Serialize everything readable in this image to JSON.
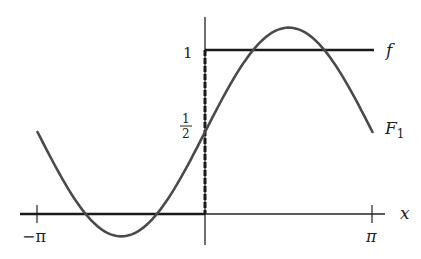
{
  "chart_data": {
    "type": "line",
    "title": "",
    "xlabel": "x",
    "ylabel": "",
    "xlim": [
      -3.14159,
      3.14159
    ],
    "ylim": [
      0,
      1
    ],
    "grid": false,
    "x_ticks": [
      "-π",
      "π"
    ],
    "y_ticks": [
      "1/2",
      "1"
    ],
    "series": [
      {
        "name": "f",
        "style": "step (0 for x<0, 1 for x>0), dashed vertical jump at x=0",
        "x": [
          -3.14159,
          0,
          0,
          3.14159
        ],
        "y": [
          0,
          0,
          1,
          1
        ]
      },
      {
        "name": "F_1",
        "formula": "1/2 + (2/π) sin x",
        "x": [
          -3.14159,
          -1.5708,
          0,
          1.5708,
          3.14159
        ],
        "y": [
          0.5,
          -0.137,
          0.5,
          1.137,
          0.5
        ]
      }
    ]
  },
  "labels": {
    "x_axis": "x",
    "neg_pi": "−π",
    "pi": "π",
    "one": "1",
    "half_num": "1",
    "half_den": "2",
    "f": "f",
    "F1_main": "F",
    "F1_sub": "1"
  }
}
